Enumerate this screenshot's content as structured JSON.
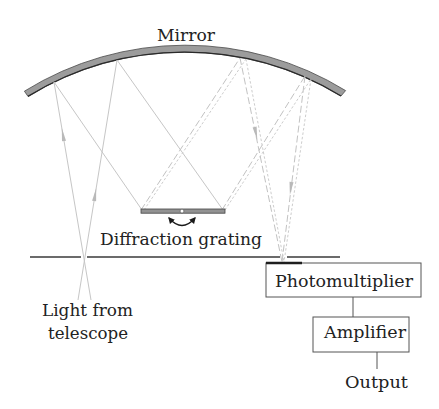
{
  "diagram": {
    "labels": {
      "mirror": "Mirror",
      "grating": "Diffraction grating",
      "light_source_line1": "Light from",
      "light_source_line2": "telescope",
      "photomultiplier": "Photomultiplier",
      "amplifier": "Amplifier",
      "output": "Output"
    }
  }
}
